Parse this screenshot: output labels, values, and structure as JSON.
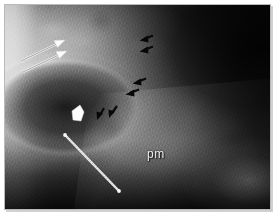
{
  "figure": {
    "modality": "radiograph",
    "caption_label": "pm",
    "background_color": "#ffffff",
    "frame_border_color": "#b9b9b9"
  },
  "annotations": {
    "text_labels": [
      {
        "id": "pm",
        "text": "pm",
        "x": 146,
        "y": 150,
        "color": "#efefef"
      }
    ],
    "white_arrows": [
      {
        "id": "white-arrow-upper",
        "tail_x": 16,
        "tail_y": 56,
        "tip_x": 58,
        "tip_y": 36,
        "color": "#f2f2f2"
      },
      {
        "id": "white-arrow-lower",
        "tail_x": 18,
        "tail_y": 67,
        "tip_x": 60,
        "tip_y": 47,
        "color": "#f2f2f2"
      }
    ],
    "white_arrowhead": {
      "id": "white-solid-arrowhead",
      "x": 73,
      "y": 108,
      "color": "#fbfbfb"
    },
    "white_caliper_bar": {
      "id": "measurement-bar",
      "start_x": 60,
      "start_y": 130,
      "end_x": 114,
      "end_y": 186,
      "color": "#f0f0f0"
    },
    "black_arrows": [
      {
        "id": "black-arrow-1",
        "tip_x": 138,
        "tip_y": 34,
        "angle_deg": 200,
        "color": "#0a0a0a"
      },
      {
        "id": "black-arrow-2",
        "tip_x": 138,
        "tip_y": 45,
        "angle_deg": 200,
        "color": "#0a0a0a"
      },
      {
        "id": "black-arrow-3",
        "tip_x": 131,
        "tip_y": 77,
        "angle_deg": 200,
        "color": "#0a0a0a"
      },
      {
        "id": "black-arrow-4",
        "tip_x": 124,
        "tip_y": 88,
        "angle_deg": 200,
        "color": "#0a0a0a"
      },
      {
        "id": "black-arrow-5",
        "tip_x": 106,
        "tip_y": 110,
        "angle_deg": 195,
        "color": "#0a0a0a"
      },
      {
        "id": "black-arrow-6",
        "tip_x": 94,
        "tip_y": 112,
        "angle_deg": 195,
        "color": "#0a0a0a"
      }
    ]
  }
}
